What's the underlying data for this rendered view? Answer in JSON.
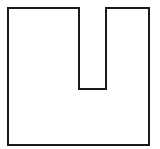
{
  "diagram": {
    "shape": "u-notched-square",
    "stroke_color": "#1a1a1a",
    "fill_color": "#ffffff",
    "stroke_width": 2,
    "points": "8,8 79,8 79,89 106,89 106,8 149,8 149,145 8,145"
  }
}
